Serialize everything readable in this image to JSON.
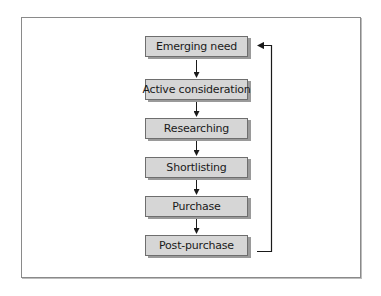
{
  "diagram": {
    "type": "flowchart",
    "steps": [
      {
        "label": "Emerging need"
      },
      {
        "label": "Active consideration"
      },
      {
        "label": "Researching"
      },
      {
        "label": "Shortlisting"
      },
      {
        "label": "Purchase"
      },
      {
        "label": "Post-purchase"
      }
    ],
    "feedback_loop": {
      "from": "Post-purchase",
      "to": "Emerging need"
    },
    "colors": {
      "box_fill": "#d6d6d6",
      "box_border": "#6e6e6e",
      "shadow": "#9a9a9a",
      "line": "#1a1a1a"
    }
  }
}
